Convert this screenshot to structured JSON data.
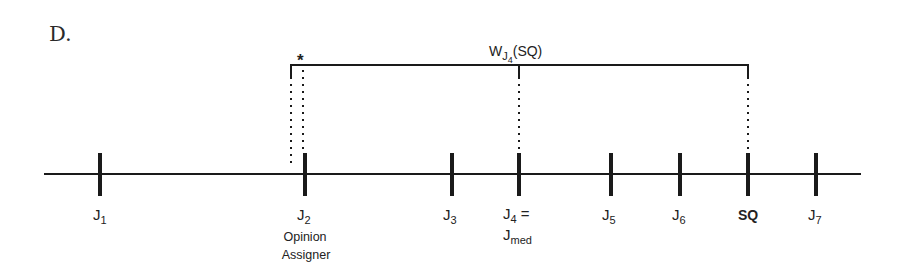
{
  "panel_label": "D.",
  "bracket": {
    "label_main": "W",
    "label_sub": "J",
    "label_subsub": "4",
    "label_tail": "(SQ)",
    "marker": "*"
  },
  "axis": {
    "points": [
      {
        "id": "j1",
        "main": "J",
        "sub": "1",
        "x": 100
      },
      {
        "id": "j2",
        "main": "J",
        "sub": "2",
        "x": 305,
        "note_line1": "Opinion",
        "note_line2": "Assigner"
      },
      {
        "id": "j3",
        "main": "J",
        "sub": "3",
        "x": 452
      },
      {
        "id": "j4",
        "main": "J",
        "sub": "4",
        "suffix": " =",
        "x": 519,
        "note_main": "J",
        "note_sub": "med"
      },
      {
        "id": "j5",
        "main": "J",
        "sub": "5",
        "x": 611
      },
      {
        "id": "j6",
        "main": "J",
        "sub": "6",
        "x": 680
      },
      {
        "id": "sq",
        "main": "SQ",
        "x": 748,
        "bold": true
      },
      {
        "id": "j7",
        "main": "J",
        "sub": "7",
        "x": 816
      }
    ]
  }
}
